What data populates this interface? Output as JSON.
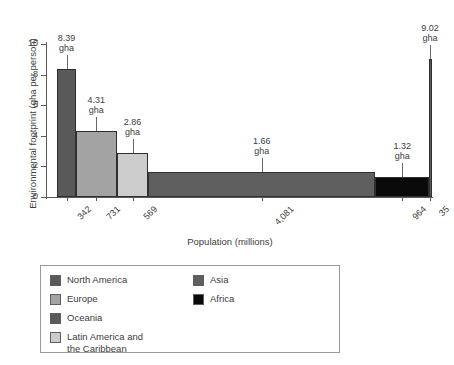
{
  "chart_data": {
    "type": "bar",
    "title": "",
    "xlabel": "Population (millions)",
    "ylabel": "Environmental footprint (gha per person)",
    "ylim": [
      0,
      10
    ],
    "yticks": [
      0,
      2,
      4,
      6,
      8,
      10
    ],
    "grid": false,
    "legend_position": "below-plot",
    "note": "Variable-width bar chart: bar width is proportional to population (millions), bar height is environmental footprint (gha per person).",
    "categories": [
      "North America",
      "Europe",
      "Latin America and the Caribbean",
      "Asia",
      "Africa",
      "Oceania"
    ],
    "xtick_labels": [
      "342",
      "731",
      "569",
      "4,081",
      "964",
      "35"
    ],
    "populations": [
      342,
      731,
      569,
      4081,
      964,
      35
    ],
    "values": [
      8.39,
      4.31,
      2.86,
      1.66,
      1.32,
      9.02
    ],
    "value_labels": [
      "8.39\ngha",
      "4.31\ngha",
      "2.86\ngha",
      "1.66\ngha",
      "1.32\ngha",
      "9.02\ngha"
    ],
    "unit": "gha",
    "series": [
      {
        "name": "Environmental footprint",
        "points": [
          {
            "region": "North America",
            "population": 342,
            "footprint": 8.39,
            "xtick": "342",
            "value_label": "8.39",
            "unit_label": "gha",
            "color": "#595959"
          },
          {
            "region": "Europe",
            "population": 731,
            "footprint": 4.31,
            "xtick": "731",
            "value_label": "4.31",
            "unit_label": "gha",
            "color": "#a3a3a3"
          },
          {
            "region": "Latin America and the Caribbean",
            "population": 569,
            "footprint": 2.86,
            "xtick": "569",
            "value_label": "2.86",
            "unit_label": "gha",
            "color": "#cccccc"
          },
          {
            "region": "Asia",
            "population": 4081,
            "footprint": 1.66,
            "xtick": "4,081",
            "value_label": "1.66",
            "unit_label": "gha",
            "color": "#5f5f5f"
          },
          {
            "region": "Africa",
            "population": 964,
            "footprint": 1.32,
            "xtick": "964",
            "value_label": "1.32",
            "unit_label": "gha",
            "color": "#0a0a0a"
          },
          {
            "region": "Oceania",
            "population": 35,
            "footprint": 9.02,
            "xtick": "35",
            "value_label": "9.02",
            "unit_label": "gha",
            "color": "#5a5a5a"
          }
        ]
      }
    ]
  },
  "axes": {
    "y_title": "Environmental footprint (gha per person)",
    "x_title": "Population (millions)",
    "y_tick_labels": [
      "10",
      "8",
      "6",
      "4",
      "2",
      "0"
    ]
  },
  "legend": {
    "column_1": [
      {
        "label": "North America",
        "color": "#595959"
      },
      {
        "label": "Europe",
        "color": "#a3a3a3"
      },
      {
        "label": "Oceania",
        "color": "#5a5a5a"
      },
      {
        "label": "Latin America and\nthe Caribbean",
        "color": "#cccccc"
      }
    ],
    "column_2": [
      {
        "label": "Asia",
        "color": "#5f5f5f"
      },
      {
        "label": "Africa",
        "color": "#0a0a0a"
      }
    ]
  }
}
